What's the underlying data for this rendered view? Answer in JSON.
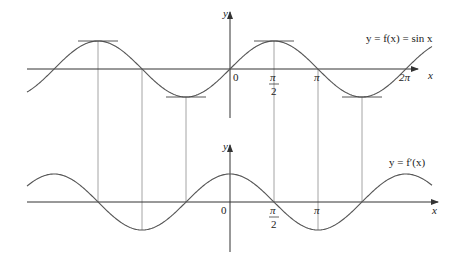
{
  "colors": {
    "axis": "#333333",
    "curve": "#555555",
    "guide": "#999999",
    "text": "#222222"
  },
  "top_graph": {
    "function_label": "y = f(x) = sin x",
    "y_axis_label": "y",
    "x_axis_label": "x",
    "origin_label": "0",
    "tick_labels": {
      "half_pi_num": "π",
      "half_pi_den": "2",
      "pi": "π",
      "two_pi": "2π"
    }
  },
  "bottom_graph": {
    "function_label": "y = f′(x)",
    "y_axis_label": "y",
    "x_axis_label": "x",
    "origin_label": "0",
    "tick_labels": {
      "half_pi_num": "π",
      "half_pi_den": "2",
      "pi": "π"
    }
  },
  "chart_data": [
    {
      "type": "line",
      "title": "y = f(x) = sin x",
      "xlabel": "x",
      "ylabel": "y",
      "xlim": [
        -7.2,
        7.2
      ],
      "ylim": [
        -1,
        1
      ],
      "x_ticks": [
        "0",
        "π/2",
        "π",
        "2π"
      ],
      "series": [
        {
          "name": "sin x",
          "expression": "sin(x)"
        }
      ],
      "horizontal_tangents_at": [
        "-3π/2",
        "-π/2",
        "π/2",
        "3π/2"
      ],
      "grid": false
    },
    {
      "type": "line",
      "title": "y = f′(x)",
      "xlabel": "x",
      "ylabel": "y",
      "xlim": [
        -7.2,
        7.2
      ],
      "ylim": [
        -1,
        1
      ],
      "x_ticks": [
        "0",
        "π/2",
        "π"
      ],
      "series": [
        {
          "name": "f′(x)",
          "expression": "cos(x)"
        }
      ],
      "zeros_at": [
        "-3π/2",
        "-π/2",
        "π/2",
        "3π/2"
      ],
      "grid": false
    }
  ]
}
